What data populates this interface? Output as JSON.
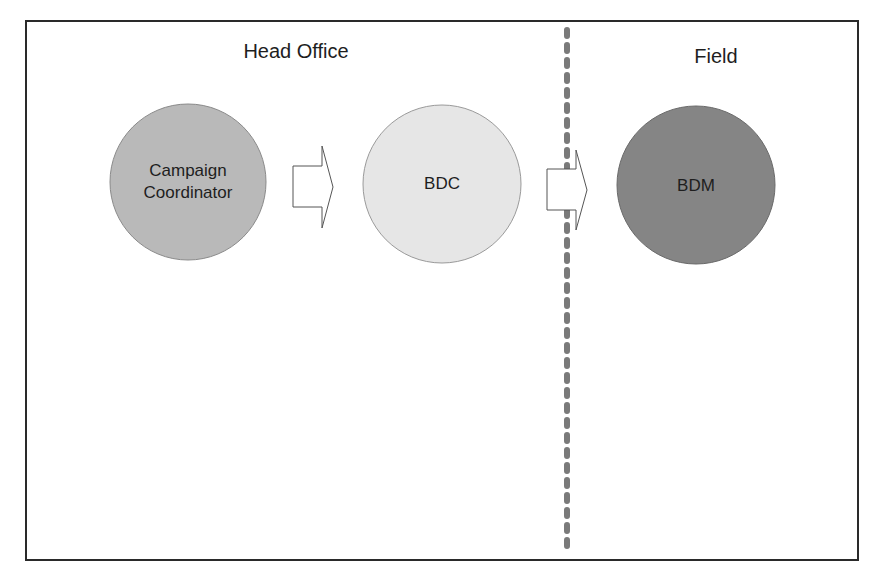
{
  "diagram": {
    "type": "process-flow",
    "regions": [
      {
        "id": "head-office",
        "label": "Head Office"
      },
      {
        "id": "field",
        "label": "Field"
      }
    ],
    "nodes": [
      {
        "id": "campaign-coordinator",
        "line1": "Campaign",
        "line2": "Coordinator",
        "region": "head-office",
        "fill": "#b9b9b9"
      },
      {
        "id": "bdc",
        "label": "BDC",
        "region": "head-office",
        "fill": "#e6e6e6"
      },
      {
        "id": "bdm",
        "label": "BDM",
        "region": "field",
        "fill": "#858585"
      }
    ],
    "edges": [
      {
        "from": "campaign-coordinator",
        "to": "bdc",
        "style": "block-arrow"
      },
      {
        "from": "bdc",
        "to": "bdm",
        "style": "block-arrow"
      }
    ],
    "divider": {
      "style": "dashed",
      "color": "#7a7a7a"
    }
  }
}
